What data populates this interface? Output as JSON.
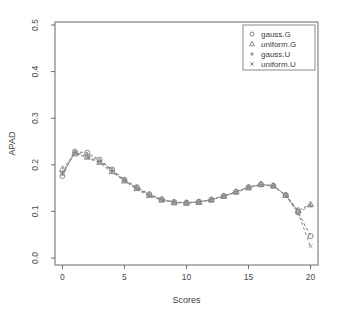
{
  "chart_data": {
    "type": "line",
    "title": "",
    "xlabel": "Scores",
    "ylabel": "APAD",
    "xlim": [
      -0.6,
      20.6
    ],
    "ylim": [
      0.0,
      0.5
    ],
    "xticks": [
      0,
      5,
      10,
      15,
      20
    ],
    "xticklabels": [
      "0",
      "5",
      "10",
      "15",
      "20"
    ],
    "yticks": [
      0.0,
      0.1,
      0.2,
      0.3,
      0.4,
      0.5
    ],
    "yticklabels": [
      "0.0",
      "0.1",
      "0.2",
      "0.3",
      "0.4",
      "0.5"
    ],
    "grid": false,
    "legend_position": "top-right",
    "x": [
      0,
      1,
      2,
      3,
      4,
      5,
      6,
      7,
      8,
      9,
      10,
      11,
      12,
      13,
      14,
      15,
      16,
      17,
      18,
      19,
      20
    ],
    "series": [
      {
        "name": "gauss.G",
        "marker": "circle",
        "color": "#7a7a7a",
        "values": [
          0.176,
          0.228,
          0.226,
          0.211,
          0.19,
          0.168,
          0.152,
          0.137,
          0.126,
          0.12,
          0.119,
          0.121,
          0.125,
          0.133,
          0.142,
          0.152,
          0.158,
          0.155,
          0.135,
          0.098,
          0.047
        ]
      },
      {
        "name": "uniform.G",
        "marker": "triangle",
        "color": "#7a7a7a",
        "values": [
          0.191,
          0.224,
          0.217,
          0.206,
          0.186,
          0.166,
          0.15,
          0.135,
          0.125,
          0.119,
          0.118,
          0.12,
          0.125,
          0.133,
          0.142,
          0.151,
          0.158,
          0.155,
          0.135,
          0.102,
          0.115
        ]
      },
      {
        "name": "gauss.U",
        "marker": "plus",
        "color": "#8c8c8c",
        "values": [
          0.183,
          0.226,
          0.221,
          0.209,
          0.188,
          0.167,
          0.151,
          0.136,
          0.125,
          0.12,
          0.118,
          0.12,
          0.125,
          0.133,
          0.142,
          0.152,
          0.158,
          0.155,
          0.135,
          0.097,
          0.113
        ]
      },
      {
        "name": "uniform.U",
        "marker": "cross",
        "color": "#8c8c8c",
        "values": [
          0.18,
          0.227,
          0.215,
          0.204,
          0.184,
          0.165,
          0.147,
          0.133,
          0.124,
          0.119,
          0.118,
          0.12,
          0.125,
          0.132,
          0.141,
          0.151,
          0.157,
          0.154,
          0.134,
          0.096,
          0.025
        ]
      }
    ],
    "legend_entries": [
      {
        "label": "gauss.G",
        "marker": "circle"
      },
      {
        "label": "uniform.G",
        "marker": "triangle"
      },
      {
        "label": "gauss.U",
        "marker": "plus"
      },
      {
        "label": "uniform.U",
        "marker": "cross"
      }
    ]
  }
}
